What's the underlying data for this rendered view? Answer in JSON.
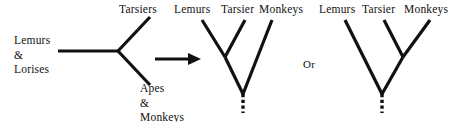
{
  "figure": {
    "background_color": "#ffffff",
    "stroke_color": "#111111",
    "width": 468,
    "height": 122
  },
  "unrooted_tree": {
    "name": "unrooted-three-way-tree",
    "taxa": [
      {
        "id": "lemurs-lorises",
        "label_lines": [
          "Lemurs",
          "&",
          "Lorises"
        ],
        "position": "left"
      },
      {
        "id": "tarsiers",
        "label_lines": [
          "Tarsiers"
        ],
        "position": "upper-right"
      },
      {
        "id": "apes-monkeys",
        "label_lines": [
          "Apes",
          "&",
          "Monkeys"
        ],
        "position": "lower-right"
      }
    ],
    "labels": {
      "lemurs_lorises_line1": "Lemurs",
      "lemurs_lorises_line2": "&",
      "lemurs_lorises_line3": "Lorises",
      "tarsiers": "Tarsiers",
      "apes_monkeys_line1": "Apes",
      "apes_monkeys_line2": "&",
      "apes_monkeys_line3": "Monkeys"
    }
  },
  "arrow": {
    "name": "resolution-arrow",
    "direction": "right",
    "glyph": "→"
  },
  "conjunction": {
    "label": "Or"
  },
  "rooted_trees": [
    {
      "id": "tree-lemurs-tarsier-sister",
      "tip_labels": [
        "Lemurs",
        "Tarsier",
        "Monkeys"
      ],
      "topology": "((Lemurs,Tarsier),Monkeys)",
      "root_stem": "dashed",
      "tips": {
        "left": "Lemurs",
        "middle": "Tarsier",
        "right": "Monkeys"
      }
    },
    {
      "id": "tree-tarsier-monkeys-sister",
      "tip_labels": [
        "Lemurs",
        "Tarsier",
        "Monkeys"
      ],
      "topology": "(Lemurs,(Tarsier,Monkeys))",
      "root_stem": "dashed",
      "tips": {
        "left": "Lemurs",
        "middle": "Tarsier",
        "right": "Monkeys"
      }
    }
  ]
}
